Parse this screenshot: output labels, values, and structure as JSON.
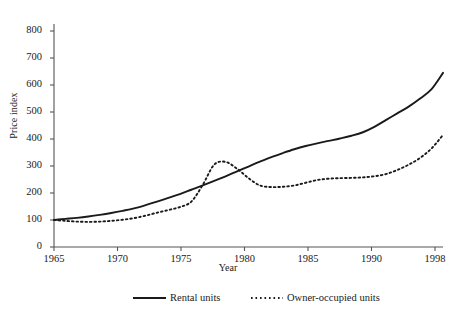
{
  "axes": {
    "ylabel": "Price index",
    "xlabel": "Year",
    "yticks": [
      "0",
      "100",
      "200",
      "300",
      "400",
      "500",
      "600",
      "700",
      "800"
    ],
    "xticks": [
      "1965",
      "1970",
      "1975",
      "1980",
      "1985",
      "1990",
      "1998"
    ]
  },
  "legend": {
    "rental": "Rental units",
    "owner": "Owner-occupied units"
  },
  "colors": {
    "ink": "#1a1a1a",
    "axis": "#555555"
  },
  "chart_data": {
    "type": "line",
    "title": "",
    "xlabel": "Year",
    "ylabel": "Price index",
    "xlim": [
      1965,
      1999
    ],
    "ylim": [
      0,
      800
    ],
    "grid": false,
    "legend_position": "bottom",
    "xticks": [
      1965,
      1970,
      1975,
      1980,
      1985,
      1990,
      1998
    ],
    "yticks": [
      0,
      100,
      200,
      300,
      400,
      500,
      600,
      700,
      800
    ],
    "x": [
      1965,
      1966,
      1967,
      1968,
      1969,
      1970,
      1971,
      1972,
      1973,
      1974,
      1975,
      1976,
      1977,
      1978,
      1979,
      1980,
      1981,
      1982,
      1983,
      1984,
      1985,
      1986,
      1987,
      1988,
      1989,
      1990,
      1991,
      1992,
      1993,
      1994,
      1995,
      1996,
      1997,
      1998,
      1999
    ],
    "series": [
      {
        "name": "Rental units",
        "style": "solid",
        "values": [
          100,
          104,
          108,
          113,
          119,
          126,
          134,
          143,
          155,
          168,
          182,
          196,
          212,
          228,
          245,
          262,
          280,
          298,
          316,
          333,
          348,
          362,
          374,
          384,
          393,
          402,
          412,
          425,
          445,
          470,
          495,
          520,
          550,
          585,
          645
        ]
      },
      {
        "name": "Owner-occupied units",
        "style": "dotted",
        "values": [
          100,
          97,
          94,
          93,
          94,
          97,
          101,
          107,
          116,
          127,
          137,
          148,
          168,
          230,
          305,
          315,
          290,
          255,
          228,
          222,
          223,
          228,
          238,
          248,
          253,
          255,
          256,
          258,
          262,
          270,
          285,
          305,
          330,
          365,
          415
        ]
      }
    ]
  }
}
